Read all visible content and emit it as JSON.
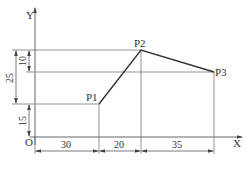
{
  "diagram": {
    "axes": {
      "x_label": "X",
      "y_label": "Y",
      "origin_label": "O"
    },
    "points": [
      {
        "label": "P1",
        "x": 30,
        "y": 15
      },
      {
        "label": "P2",
        "x": 50,
        "y": 40
      },
      {
        "label": "P3",
        "x": 85,
        "y": 30
      }
    ],
    "dimensions": {
      "horizontal": [
        "30",
        "20",
        "35"
      ],
      "vertical": {
        "p1_height": "15",
        "p1_to_p2": "25",
        "p3_to_p2": "10"
      }
    },
    "colors": {
      "line": "#333333",
      "thin": "#555555",
      "background": "#ffffff"
    }
  }
}
